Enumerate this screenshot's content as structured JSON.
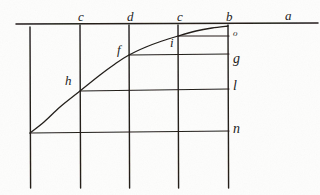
{
  "figure": {
    "medium": "ink on paper scan",
    "ink_color": "#201c19",
    "paper_color": "#fdfdfc",
    "axis_label_right": "a",
    "top_labels": [
      {
        "text": "c",
        "x": 78,
        "y": 10
      },
      {
        "text": "d",
        "x": 127,
        "y": 10
      },
      {
        "text": "c",
        "x": 177,
        "y": 10
      },
      {
        "text": "b",
        "x": 226,
        "y": 10
      },
      {
        "text": "a",
        "x": 285,
        "y": 9
      }
    ],
    "right_labels": [
      {
        "text": "o",
        "x": 233,
        "y": 29,
        "size": "small"
      },
      {
        "text": "g",
        "x": 233,
        "y": 52,
        "size": "normal"
      },
      {
        "text": "l",
        "x": 233,
        "y": 79,
        "size": "normal"
      },
      {
        "text": "n",
        "x": 233,
        "y": 122,
        "size": "normal"
      }
    ],
    "curve_labels": [
      {
        "text": "h",
        "x": 65,
        "y": 74
      },
      {
        "text": "f",
        "x": 117,
        "y": 43
      },
      {
        "text": "i",
        "x": 170,
        "y": 36
      }
    ],
    "axis": {
      "name": "horizontal-axis-ab",
      "x1": 16,
      "y1": 24,
      "x2": 318,
      "y2": 23
    },
    "verticals": [
      {
        "name": "vertical-left-edge",
        "x": 30,
        "y1": 27,
        "y2": 188
      },
      {
        "name": "vertical-c",
        "x": 80,
        "y1": 25,
        "y2": 188
      },
      {
        "name": "vertical-d",
        "x": 129,
        "y1": 25,
        "y2": 188
      },
      {
        "name": "vertical-e",
        "x": 178,
        "y1": 25,
        "y2": 188
      },
      {
        "name": "vertical-b",
        "x": 228,
        "y1": 25,
        "y2": 188
      }
    ],
    "horizontals": [
      {
        "name": "horizontal-o",
        "x1": 178,
        "y1": 36,
        "x2": 229,
        "y2": 36
      },
      {
        "name": "horizontal-g",
        "x1": 129,
        "y1": 55,
        "x2": 229,
        "y2": 54
      },
      {
        "name": "horizontal-l",
        "x1": 80,
        "y1": 91,
        "x2": 229,
        "y2": 89
      },
      {
        "name": "horizontal-n",
        "x1": 30,
        "y1": 133,
        "x2": 229,
        "y2": 131
      }
    ],
    "curve": {
      "name": "logarithmic-curve",
      "description": "rising concave curve from lower-left asymptotic to axis ab",
      "points": [
        {
          "x": 30,
          "y": 133
        },
        {
          "x": 44,
          "y": 122
        },
        {
          "x": 60,
          "y": 107
        },
        {
          "x": 80,
          "y": 91
        },
        {
          "x": 100,
          "y": 75
        },
        {
          "x": 115,
          "y": 64
        },
        {
          "x": 129,
          "y": 55
        },
        {
          "x": 146,
          "y": 47
        },
        {
          "x": 162,
          "y": 41
        },
        {
          "x": 178,
          "y": 36
        },
        {
          "x": 196,
          "y": 31
        },
        {
          "x": 212,
          "y": 28
        },
        {
          "x": 228,
          "y": 26
        }
      ]
    }
  }
}
